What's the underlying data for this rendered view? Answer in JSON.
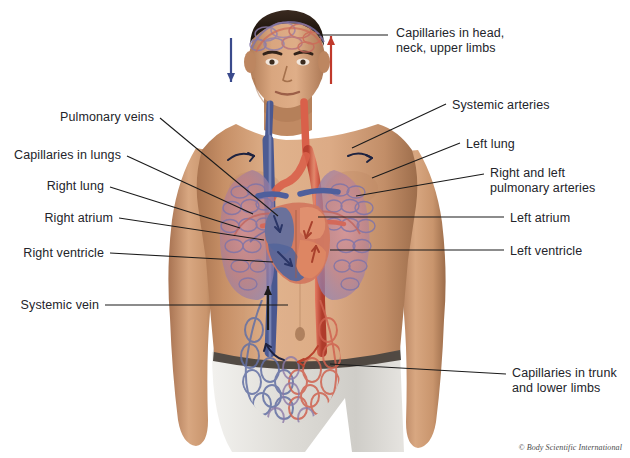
{
  "figure": {
    "width": 630,
    "height": 458,
    "background": "#ffffff"
  },
  "credit": {
    "text": "© Body Scientific International"
  },
  "colors": {
    "artery_red": "#d94f3d",
    "vein_blue": "#5f6fa5",
    "capillary_purple": "#8e7fae",
    "leader_line": "#1b1b1b",
    "label_text": "#23242a",
    "skin_light": "#e2b793",
    "skin_mid": "#c89470",
    "skin_shadow": "#a0714f",
    "hair_dark": "#2a1d17",
    "shorts_white": "#e9e9e7",
    "waistband_dark": "#3a332e",
    "lung_pink": "#cf8f96",
    "heart_salmon": "#e08a6b"
  },
  "labels": [
    {
      "id": "capillaries-head",
      "side": "right",
      "lines": [
        "Capillaries in head,",
        "neck, upper limbs"
      ],
      "text_x": 396,
      "text_y": 26,
      "leader": [
        [
          388,
          35
        ],
        [
          318,
          35
        ]
      ]
    },
    {
      "id": "systemic-arteries",
      "side": "right",
      "lines": [
        "Systemic arteries"
      ],
      "text_x": 452,
      "text_y": 98,
      "leader": [
        [
          446,
          104
        ],
        [
          352,
          148
        ]
      ]
    },
    {
      "id": "left-lung",
      "side": "right",
      "lines": [
        "Left lung"
      ],
      "text_x": 466,
      "text_y": 137,
      "leader": [
        [
          460,
          143
        ],
        [
          372,
          178
        ]
      ]
    },
    {
      "id": "pulmonary-arteries",
      "side": "right",
      "lines": [
        "Right and left",
        "pulmonary arteries"
      ],
      "text_x": 490,
      "text_y": 166,
      "leader": [
        [
          484,
          174
        ],
        [
          356,
          196
        ]
      ]
    },
    {
      "id": "left-atrium",
      "side": "right",
      "lines": [
        "Left atrium"
      ],
      "text_x": 510,
      "text_y": 211,
      "leader": [
        [
          504,
          217
        ],
        [
          318,
          217
        ]
      ]
    },
    {
      "id": "left-ventricle",
      "side": "right",
      "lines": [
        "Left ventricle"
      ],
      "text_x": 510,
      "text_y": 244,
      "leader": [
        [
          504,
          250
        ],
        [
          330,
          250
        ]
      ]
    },
    {
      "id": "capillaries-trunk",
      "side": "right",
      "lines": [
        "Capillaries in trunk",
        "and lower limbs"
      ],
      "text_x": 512,
      "text_y": 366,
      "leader": [
        [
          506,
          374
        ],
        [
          330,
          364
        ]
      ]
    },
    {
      "id": "pulmonary-veins",
      "side": "left",
      "lines": [
        "Pulmonary veins"
      ],
      "text_x": 42,
      "text_y": 110,
      "leader": [
        [
          160,
          118
        ],
        [
          278,
          216
        ]
      ]
    },
    {
      "id": "capillaries-lungs",
      "side": "left",
      "lines": [
        "Capillaries in lungs"
      ],
      "text_x": 8,
      "text_y": 148,
      "leader": [
        [
          127,
          156
        ],
        [
          253,
          214
        ]
      ]
    },
    {
      "id": "right-lung",
      "side": "left",
      "lines": [
        "Right lung"
      ],
      "text_x": 32,
      "text_y": 179,
      "leader": [
        [
          110,
          187
        ],
        [
          240,
          228
        ]
      ]
    },
    {
      "id": "right-atrium",
      "side": "left",
      "lines": [
        "Right atrium"
      ],
      "text_x": 28,
      "text_y": 211,
      "leader": [
        [
          119,
          218
        ],
        [
          264,
          240
        ]
      ]
    },
    {
      "id": "right-ventricle",
      "side": "left",
      "lines": [
        "Right ventricle"
      ],
      "text_x": 18,
      "text_y": 246,
      "leader": [
        [
          110,
          253
        ],
        [
          273,
          262
        ]
      ]
    },
    {
      "id": "systemic-vein",
      "side": "left",
      "lines": [
        "Systemic vein"
      ],
      "text_x": 20,
      "text_y": 298,
      "leader": [
        [
          105,
          305
        ],
        [
          288,
          305
        ]
      ]
    }
  ],
  "flow_arrows": [
    {
      "id": "arrow-down-blue",
      "direction": "down",
      "color": "#3a4a8c",
      "x": 231,
      "y_top": 38,
      "y_bottom": 82
    },
    {
      "id": "arrow-up-red",
      "direction": "up",
      "color": "#c0392b",
      "x": 331,
      "y_top": 36,
      "y_bottom": 84
    },
    {
      "id": "arrow-up-vein-abdomen",
      "direction": "up",
      "color": "#1b1b1b",
      "x": 268,
      "y_top": 286,
      "y_bottom": 330
    }
  ]
}
